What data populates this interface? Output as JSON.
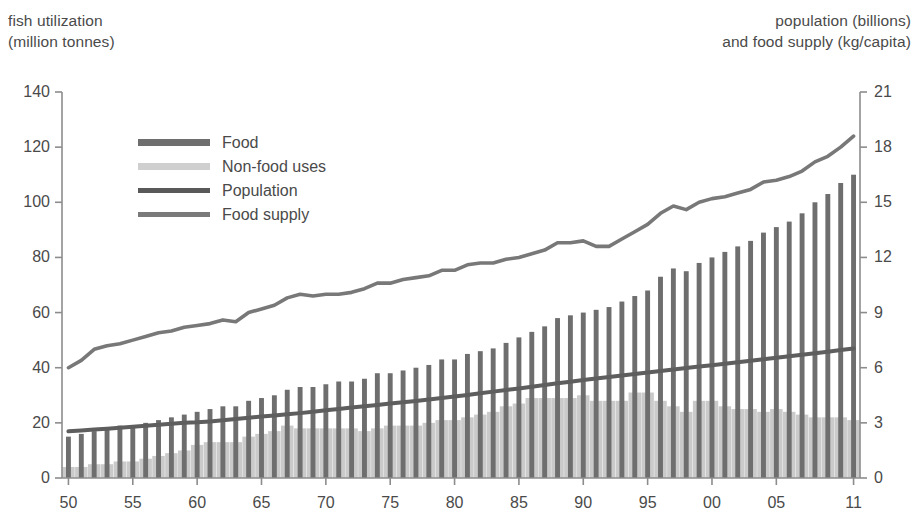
{
  "left_axis": {
    "title": "fish utilization\n(million tonnes)",
    "ticks": [
      0,
      20,
      40,
      60,
      80,
      100,
      120,
      140
    ],
    "min": 0,
    "max": 140
  },
  "right_axis": {
    "title": "population (billions)\nand food supply (kg/capita)",
    "ticks": [
      0,
      3,
      6,
      9,
      12,
      15,
      18,
      21
    ],
    "min": 0,
    "max": 21
  },
  "x_axis": {
    "tick_labels": [
      "50",
      "55",
      "60",
      "65",
      "70",
      "75",
      "80",
      "85",
      "90",
      "95",
      "00",
      "05",
      "11"
    ],
    "tick_years": [
      1950,
      1955,
      1960,
      1965,
      1970,
      1975,
      1980,
      1985,
      1990,
      1995,
      2000,
      2005,
      2011
    ]
  },
  "legend": {
    "items": [
      {
        "label": "Food",
        "color": "#6e6e6e",
        "kind": "bar"
      },
      {
        "label": "Non-food uses",
        "color": "#cfcfcf",
        "kind": "bar"
      },
      {
        "label": "Population",
        "color": "#595959",
        "kind": "line"
      },
      {
        "label": "Food supply",
        "color": "#7a7a7a",
        "kind": "line"
      }
    ]
  },
  "colors": {
    "food": "#6e6e6e",
    "nonfood": "#cacaca",
    "population_line": "#5e5e5e",
    "foodsupply_line": "#787878",
    "axis": "#8c8c8c",
    "text": "#4a4a4a",
    "background": "#ffffff"
  },
  "chart_data": {
    "type": "bar",
    "title": "",
    "subtitle": "",
    "xlabel": "",
    "ylabel": "fish utilization (million tonnes)",
    "y2label": "population (billions) and food supply (kg/capita)",
    "ylim": [
      0,
      140
    ],
    "y2lim": [
      0,
      21
    ],
    "grid": false,
    "legend_position": "upper-left",
    "x": [
      1950,
      1951,
      1952,
      1953,
      1954,
      1955,
      1956,
      1957,
      1958,
      1959,
      1960,
      1961,
      1962,
      1963,
      1964,
      1965,
      1966,
      1967,
      1968,
      1969,
      1970,
      1971,
      1972,
      1973,
      1974,
      1975,
      1976,
      1977,
      1978,
      1979,
      1980,
      1981,
      1982,
      1983,
      1984,
      1985,
      1986,
      1987,
      1988,
      1989,
      1990,
      1991,
      1992,
      1993,
      1994,
      1995,
      1996,
      1997,
      1998,
      1999,
      2000,
      2001,
      2002,
      2003,
      2004,
      2005,
      2006,
      2007,
      2008,
      2009,
      2010,
      2011
    ],
    "categories": [
      "1950",
      "1951",
      "1952",
      "1953",
      "1954",
      "1955",
      "1956",
      "1957",
      "1958",
      "1959",
      "1960",
      "1961",
      "1962",
      "1963",
      "1964",
      "1965",
      "1966",
      "1967",
      "1968",
      "1969",
      "1970",
      "1971",
      "1972",
      "1973",
      "1974",
      "1975",
      "1976",
      "1977",
      "1978",
      "1979",
      "1980",
      "1981",
      "1982",
      "1983",
      "1984",
      "1985",
      "1986",
      "1987",
      "1988",
      "1989",
      "1990",
      "1991",
      "1992",
      "1993",
      "1994",
      "1995",
      "1996",
      "1997",
      "1998",
      "1999",
      "2000",
      "2001",
      "2002",
      "2003",
      "2004",
      "2005",
      "2006",
      "2007",
      "2008",
      "2009",
      "2010",
      "2011"
    ],
    "series": [
      {
        "name": "Food",
        "axis": "left",
        "stack": "total",
        "unit": "million tonnes",
        "values": [
          15,
          16,
          17,
          18,
          19,
          19,
          20,
          21,
          22,
          23,
          24,
          25,
          26,
          26,
          28,
          29,
          30,
          32,
          33,
          33,
          34,
          35,
          35,
          36,
          38,
          38,
          39,
          40,
          41,
          43,
          43,
          45,
          46,
          47,
          49,
          51,
          53,
          55,
          58,
          59,
          60,
          61,
          62,
          64,
          66,
          68,
          73,
          76,
          75,
          78,
          80,
          82,
          84,
          86,
          89,
          91,
          93,
          96,
          100,
          103,
          107,
          110
        ],
        "note": "height of dark bar = total utilization; food = total minus non-food"
      },
      {
        "name": "Non-food uses",
        "axis": "left",
        "stack": "base",
        "unit": "million tonnes",
        "values": [
          4,
          4,
          5,
          5,
          6,
          6,
          7,
          8,
          9,
          10,
          12,
          13,
          13,
          13,
          15,
          16,
          17,
          19,
          18,
          18,
          18,
          18,
          18,
          17,
          18,
          19,
          19,
          19,
          20,
          21,
          21,
          22,
          23,
          24,
          26,
          27,
          29,
          29,
          29,
          29,
          30,
          28,
          28,
          28,
          31,
          31,
          28,
          26,
          24,
          28,
          28,
          26,
          25,
          25,
          24,
          25,
          24,
          23,
          22,
          22,
          22,
          21
        ],
        "note": "light grey stacked portion at the bottom of each bar"
      },
      {
        "name": "Population",
        "axis": "right",
        "type": "line",
        "unit": "billions",
        "values": [
          2.54,
          2.59,
          2.64,
          2.68,
          2.73,
          2.79,
          2.84,
          2.9,
          2.95,
          3.0,
          3.03,
          3.08,
          3.14,
          3.21,
          3.28,
          3.34,
          3.4,
          3.47,
          3.53,
          3.6,
          3.68,
          3.76,
          3.83,
          3.9,
          3.97,
          4.05,
          4.12,
          4.19,
          4.27,
          4.35,
          4.43,
          4.52,
          4.61,
          4.7,
          4.79,
          4.87,
          4.96,
          5.06,
          5.15,
          5.24,
          5.33,
          5.41,
          5.49,
          5.58,
          5.66,
          5.74,
          5.82,
          5.9,
          5.98,
          6.06,
          6.14,
          6.22,
          6.3,
          6.38,
          6.46,
          6.54,
          6.62,
          6.7,
          6.79,
          6.87,
          6.96,
          7.04
        ],
        "note": "rising, nearly-straight dark line from about 2.5 to 7.0 billion"
      },
      {
        "name": "Food supply",
        "axis": "right",
        "type": "line",
        "unit": "kg/capita",
        "values": [
          6.0,
          6.4,
          7.0,
          7.2,
          7.3,
          7.5,
          7.7,
          7.9,
          8.0,
          8.2,
          8.3,
          8.4,
          8.6,
          8.5,
          9.0,
          9.2,
          9.4,
          9.8,
          10.0,
          9.9,
          10.0,
          10.0,
          10.1,
          10.3,
          10.6,
          10.6,
          10.8,
          10.9,
          11.0,
          11.3,
          11.3,
          11.6,
          11.7,
          11.7,
          11.9,
          12.0,
          12.2,
          12.4,
          12.8,
          12.8,
          12.9,
          12.6,
          12.6,
          13.0,
          13.4,
          13.8,
          14.4,
          14.8,
          14.6,
          15.0,
          15.2,
          15.3,
          15.5,
          15.7,
          16.1,
          16.2,
          16.4,
          16.7,
          17.2,
          17.5,
          18.0,
          18.6
        ],
        "note": "rising medium-grey line from about 6 to 19 kg/capita"
      }
    ]
  }
}
